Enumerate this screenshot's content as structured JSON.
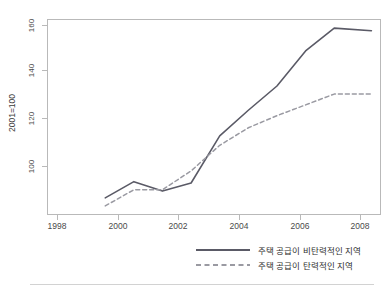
{
  "chart_data": {
    "type": "line",
    "title": "",
    "xlabel": "",
    "ylabel": "2001=100",
    "xlim": [
      1997,
      2008.6
    ],
    "ylim": [
      92,
      164
    ],
    "xticks": [
      1998,
      2000,
      2002,
      2004,
      2006,
      2008
    ],
    "yticks": [
      100,
      120,
      140,
      160
    ],
    "grid": false,
    "legend_position": "bottom-right",
    "x": [
      1999,
      2000,
      2001,
      2002,
      2003,
      2004,
      2005,
      2006,
      2007,
      2008.3
    ],
    "series": [
      {
        "name": "주택 공급이 비탄력적인 지역",
        "style": "solid",
        "color": "#5a5a66",
        "values": [
          98,
          104,
          100.5,
          103.5,
          121,
          130.5,
          139.5,
          152.5,
          161,
          160
        ]
      },
      {
        "name": "주택 공급이 탄력적인 지역",
        "style": "dashed",
        "color": "#9a9aa2",
        "values": [
          95,
          101,
          101,
          108,
          117.5,
          124,
          128.5,
          132.5,
          136.5,
          136.5
        ]
      }
    ]
  },
  "axis": {
    "y_title": "2001=100",
    "y_tick_labels": [
      "160",
      "140",
      "120",
      "100"
    ],
    "x_tick_labels": [
      "1998",
      "2000",
      "2002",
      "2004",
      "2006",
      "2008"
    ]
  },
  "legend": {
    "items": [
      {
        "label": "주택 공급이 비탄력적인 지역",
        "style": "solid"
      },
      {
        "label": "주택 공급이 탄력적인 지역",
        "style": "dashed"
      }
    ]
  },
  "footer": {
    "caption": ""
  },
  "colors": {
    "inelastic_line": "#5a5a66",
    "elastic_line": "#9a9aa2",
    "frame": "#b9b9b9",
    "text": "#3c3c3c"
  }
}
